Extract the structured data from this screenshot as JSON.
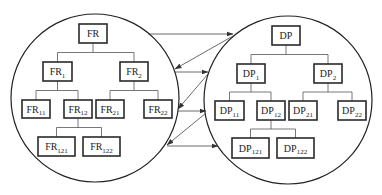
{
  "diagram": {
    "colors": {
      "stroke": "#222222",
      "background": "#ffffff"
    },
    "domains": [
      {
        "id": "functional",
        "circle": {
          "cx": 95,
          "cy": 98,
          "r": 84
        },
        "nodes": [
          {
            "id": "FR",
            "base": "FR",
            "sub": "",
            "x": 79,
            "y": 24,
            "w": 28,
            "h": 19
          },
          {
            "id": "FR1",
            "base": "FR",
            "sub": "1",
            "x": 43,
            "y": 62,
            "w": 29,
            "h": 19
          },
          {
            "id": "FR2",
            "base": "FR",
            "sub": "2",
            "x": 120,
            "y": 62,
            "w": 28,
            "h": 19
          },
          {
            "id": "FR11",
            "base": "FR",
            "sub": "11",
            "x": 22,
            "y": 100,
            "w": 28,
            "h": 18
          },
          {
            "id": "FR12",
            "base": "FR",
            "sub": "12",
            "x": 64,
            "y": 100,
            "w": 28,
            "h": 18
          },
          {
            "id": "FR21",
            "base": "FR",
            "sub": "21",
            "x": 96,
            "y": 100,
            "w": 28,
            "h": 18
          },
          {
            "id": "FR22",
            "base": "FR",
            "sub": "22",
            "x": 144,
            "y": 100,
            "w": 28,
            "h": 18
          },
          {
            "id": "FR121",
            "base": "FR",
            "sub": "121",
            "x": 38,
            "y": 137,
            "w": 37,
            "h": 19
          },
          {
            "id": "FR122",
            "base": "FR",
            "sub": "122",
            "x": 83,
            "y": 137,
            "w": 37,
            "h": 19
          }
        ]
      },
      {
        "id": "physical",
        "circle": {
          "cx": 288,
          "cy": 100,
          "r": 84
        },
        "nodes": [
          {
            "id": "DP",
            "base": "DP",
            "sub": "",
            "x": 272,
            "y": 26,
            "w": 28,
            "h": 19
          },
          {
            "id": "DP1",
            "base": "DP",
            "sub": "1",
            "x": 237,
            "y": 64,
            "w": 28,
            "h": 19
          },
          {
            "id": "DP2",
            "base": "DP",
            "sub": "2",
            "x": 314,
            "y": 64,
            "w": 28,
            "h": 19
          },
          {
            "id": "DP11",
            "base": "DP",
            "sub": "11",
            "x": 215,
            "y": 101,
            "w": 29,
            "h": 19
          },
          {
            "id": "DP12",
            "base": "DP",
            "sub": "12",
            "x": 257,
            "y": 101,
            "w": 28,
            "h": 19
          },
          {
            "id": "DP21",
            "base": "DP",
            "sub": "21",
            "x": 289,
            "y": 101,
            "w": 28,
            "h": 19
          },
          {
            "id": "DP22",
            "base": "DP",
            "sub": "22",
            "x": 338,
            "y": 101,
            "w": 28,
            "h": 19
          },
          {
            "id": "DP121",
            "base": "DP",
            "sub": "121",
            "x": 232,
            "y": 138,
            "w": 37,
            "h": 20
          },
          {
            "id": "DP122",
            "base": "DP",
            "sub": "122",
            "x": 277,
            "y": 138,
            "w": 37,
            "h": 20
          }
        ]
      }
    ],
    "hierarchy_edges": [
      [
        "FR",
        "FR1"
      ],
      [
        "FR",
        "FR2"
      ],
      [
        "FR1",
        "FR11"
      ],
      [
        "FR1",
        "FR12"
      ],
      [
        "FR2",
        "FR21"
      ],
      [
        "FR2",
        "FR22"
      ],
      [
        "FR12",
        "FR121"
      ],
      [
        "FR12",
        "FR122"
      ],
      [
        "DP",
        "DP1"
      ],
      [
        "DP",
        "DP2"
      ],
      [
        "DP1",
        "DP11"
      ],
      [
        "DP1",
        "DP12"
      ],
      [
        "DP2",
        "DP21"
      ],
      [
        "DP2",
        "DP22"
      ],
      [
        "DP12",
        "DP121"
      ],
      [
        "DP12",
        "DP122"
      ]
    ],
    "mapping_arrows": [
      {
        "from": [
          148,
          34
        ],
        "to": [
          233,
          34
        ],
        "direction": "functional-to-physical"
      },
      {
        "from": [
          233,
          36
        ],
        "to": [
          175,
          69
        ],
        "direction": "physical-to-functional"
      },
      {
        "from": [
          175,
          72
        ],
        "to": [
          208,
          72
        ],
        "direction": "functional-to-physical"
      },
      {
        "from": [
          208,
          74
        ],
        "to": [
          178,
          109
        ],
        "direction": "physical-to-functional"
      },
      {
        "from": [
          178,
          111
        ],
        "to": [
          206,
          111
        ],
        "direction": "functional-to-physical"
      },
      {
        "from": [
          206,
          113
        ],
        "to": [
          167,
          145
        ],
        "direction": "physical-to-functional"
      },
      {
        "from": [
          167,
          146
        ],
        "to": [
          218,
          146
        ],
        "direction": "functional-to-physical"
      }
    ]
  }
}
